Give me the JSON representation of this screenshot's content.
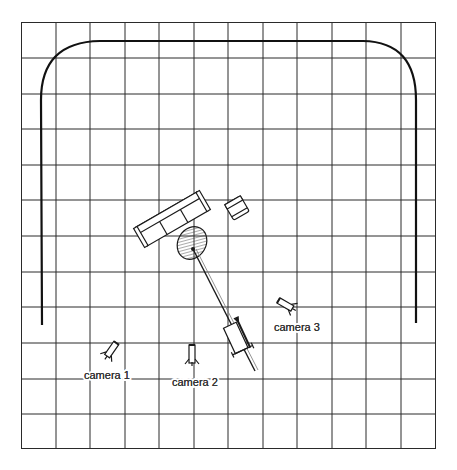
{
  "diagram": {
    "grid": {
      "columns": 12,
      "rows": 12,
      "line_color": "#2a2a2a"
    },
    "set": {
      "curtain": "cyclorama-curtain",
      "furniture": [
        "sofa",
        "armchair",
        "coffee-table"
      ],
      "equipment": [
        "boom-microphone",
        "dolly-track"
      ]
    },
    "cameras": [
      {
        "id": "camera-1",
        "label": "camera 1"
      },
      {
        "id": "camera-2",
        "label": "camera 2"
      },
      {
        "id": "camera-3",
        "label": "camera 3"
      }
    ],
    "colors": {
      "ink": "#1a1a1a",
      "label": "#333333",
      "background": "#ffffff"
    }
  }
}
